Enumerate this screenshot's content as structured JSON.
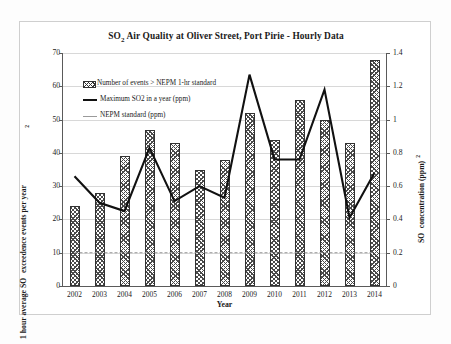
{
  "chart_data": {
    "type": "bar",
    "title": "SO2 Air Quality at Oliver Street, Port Pirie - Hourly Data",
    "title_parts": {
      "so": "SO",
      "sub": "2",
      "rest": " Air Quality at Oliver Street, Port Pirie - Hourly Data"
    },
    "xlabel": "Year",
    "ylabel_left": "1 hour average SO2 exceedence events per year",
    "ylabel_left_parts": {
      "pre": "1 hour average SO",
      "sub": "2",
      "post": " exceedence events per year"
    },
    "ylabel_right": "SO2 concentration (ppm)",
    "ylabel_right_parts": {
      "pre": "SO",
      "sup": "2",
      "post": " concentration (ppm)"
    },
    "categories": [
      "2002",
      "2003",
      "2004",
      "2005",
      "2006",
      "2007",
      "2008",
      "2009",
      "2010",
      "2011",
      "2012",
      "2013",
      "2014"
    ],
    "ylim_left": [
      0,
      70
    ],
    "yticks_left": [
      0,
      10,
      20,
      30,
      40,
      50,
      60,
      70
    ],
    "ylim_right": [
      0,
      1.4
    ],
    "yticks_right": [
      "0",
      "0.2",
      "0.4",
      "0.6",
      "0.8",
      "1",
      "1.2",
      "1.4"
    ],
    "grid": true,
    "legend_position": "top-left",
    "series": [
      {
        "name": "Number of events > NEPM 1-hr standard",
        "type": "bar",
        "axis": "left",
        "values": [
          24,
          28,
          39,
          47,
          43,
          35,
          38,
          52,
          44,
          56,
          50,
          43,
          68
        ]
      },
      {
        "name": "Maximum SO2 in a year (ppm)",
        "type": "line",
        "axis": "right",
        "values": [
          0.66,
          0.5,
          0.45,
          0.83,
          0.51,
          0.6,
          0.53,
          1.27,
          0.76,
          0.76,
          1.18,
          0.41,
          0.68
        ]
      },
      {
        "name": "NEPM standard (ppm)",
        "type": "line",
        "axis": "right",
        "constant": 0.2,
        "values": [
          0.2,
          0.2,
          0.2,
          0.2,
          0.2,
          0.2,
          0.2,
          0.2,
          0.2,
          0.2,
          0.2,
          0.2,
          0.2
        ]
      }
    ],
    "colors": {
      "bar_hatch": "#333333",
      "line": "#111111",
      "standard_line": "#9a9a9a",
      "grid": "#d8d8d8",
      "axis": "#5a5a5a"
    }
  },
  "legend": {
    "items": [
      {
        "label": "Number of events > NEPM 1-hr standard",
        "marker": "hatch-swatch"
      },
      {
        "label": "Maximum SO2 in a year (ppm)",
        "marker": "solid-line"
      },
      {
        "label": "NEPM standard (ppm)",
        "marker": "dashed-line"
      }
    ]
  }
}
